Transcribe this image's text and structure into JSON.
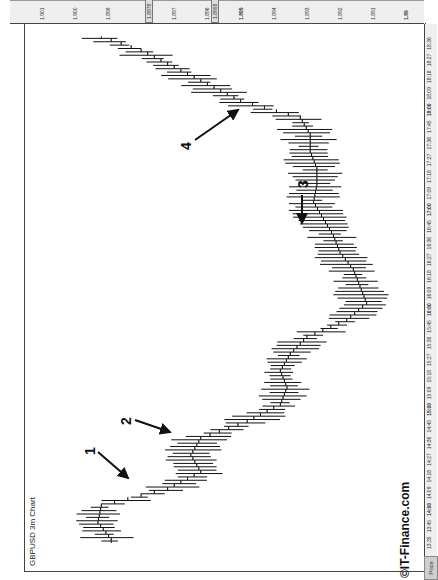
{
  "chart": {
    "title": "GBPUSD 3m Chart",
    "corner_label": "Price",
    "brand": "©IT-Finance.com"
  },
  "price_axis": [
    "1.901",
    "1.900",
    "1.899",
    "1.8978",
    "1.897",
    "1.896",
    "1.8958",
    "1.895",
    "1.894",
    "1.893",
    "1.892",
    "1.891",
    "1.89"
  ],
  "time_axis": [
    "13:35",
    "13:45",
    "14:00",
    "14:09",
    "14:18",
    "14:27",
    "14:36",
    "14:45",
    "15:00",
    "15:09",
    "15:18",
    "15:27",
    "15:36",
    "15:45",
    "16:00",
    "16:09",
    "16:18",
    "16:27",
    "16:36",
    "16:45",
    "17:00",
    "17:09",
    "17:18",
    "17:27",
    "17:36",
    "17:45",
    "18:00",
    "18:09",
    "18:18",
    "18:27",
    "18:36"
  ],
  "annotations": [
    "1",
    "2",
    "3",
    "4"
  ],
  "chart_data": {
    "type": "ohlc",
    "title": "GBPUSD 3m Chart",
    "xlabel": "Time",
    "ylabel": "Price",
    "ylim": [
      1.8895,
      1.9015
    ],
    "orientation": "rotated 90° (time runs bottom-to-top, price increases leftward)",
    "grid": false,
    "x": [
      "13:35",
      "13:45",
      "14:00",
      "14:09",
      "14:18",
      "14:27",
      "14:36",
      "14:45",
      "15:00",
      "15:09",
      "15:18",
      "15:27",
      "15:36",
      "15:45",
      "16:00",
      "16:09",
      "16:18",
      "16:27",
      "16:36",
      "16:45",
      "17:00",
      "17:09",
      "17:18",
      "17:27",
      "17:36",
      "17:45",
      "18:00",
      "18:09",
      "18:18",
      "18:27",
      "18:36"
    ],
    "series": [
      {
        "name": "GBPUSD approx close",
        "values": [
          1.8989,
          1.8993,
          1.8992,
          1.8972,
          1.8962,
          1.8965,
          1.8962,
          1.8948,
          1.8938,
          1.8936,
          1.8938,
          1.8935,
          1.893,
          1.8918,
          1.8912,
          1.8914,
          1.8916,
          1.892,
          1.8922,
          1.8925,
          1.8928,
          1.8927,
          1.8927,
          1.8929,
          1.8929,
          1.8932,
          1.895,
          1.896,
          1.897,
          1.898,
          1.8995
        ]
      }
    ],
    "highlighted_levels": [
      "1.900 area (boxed)",
      "1.8978 (boxed)",
      "1.8958 (boxed)"
    ],
    "annotations": [
      {
        "label": "1",
        "time": "13:55",
        "note": "arrow pointing at gap/spike near 1.8993"
      },
      {
        "label": "2",
        "time": "14:15",
        "note": "arrow pointing at drop start near 1.8975"
      },
      {
        "label": "3",
        "time": "16:20",
        "note": "arrow pointing at low near 1.8912"
      },
      {
        "label": "4",
        "time": "17:55",
        "note": "arrow pointing at breakout near 1.8930"
      }
    ]
  }
}
